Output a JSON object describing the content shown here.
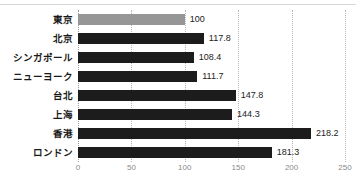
{
  "chart_data": {
    "type": "bar",
    "orientation": "horizontal",
    "title": "",
    "subtitle": "",
    "xlabel": "",
    "ylabel": "",
    "xlim": [
      0,
      250
    ],
    "xticks": [
      "0",
      "50",
      "100",
      "150",
      "200",
      "250"
    ],
    "xtick_values": [
      0,
      50,
      100,
      150,
      200,
      250
    ],
    "grid": "vertical-dotted",
    "legend": "none",
    "categories": [
      "東京",
      "北京",
      "シンガポール",
      "ニューヨーク",
      "台北",
      "上海",
      "香港",
      "ロンドン"
    ],
    "values": [
      100,
      117.8,
      108.4,
      111.7,
      147.8,
      144.3,
      218.2,
      181.3
    ],
    "value_labels": [
      "100",
      "117.8",
      "108.4",
      "111.7",
      "147.8",
      "144.3",
      "218.2",
      "181.3"
    ],
    "bar_colors": [
      "#969696",
      "#1c1c1c",
      "#1c1c1c",
      "#1c1c1c",
      "#1c1c1c",
      "#1c1c1c",
      "#1c1c1c",
      "#1c1c1c"
    ],
    "highlight_index": 0,
    "colors": {
      "highlight_bar": "#969696",
      "bar": "#1c1c1c",
      "gridline": "#b9b9b9",
      "axis_text": "#8a8a8a",
      "category_text": "#1a1a1a",
      "value_text": "#222222",
      "background": "#ffffff"
    }
  }
}
